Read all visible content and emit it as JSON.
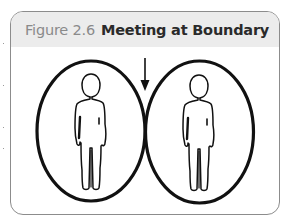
{
  "figure": {
    "number": "Figure 2.6",
    "caption": "Meeting at Boundary"
  },
  "diagram": {
    "arrow": "down-arrow-icon",
    "circles": [
      {
        "label": "left-person-boundary",
        "figure": "person-icon"
      },
      {
        "label": "right-person-boundary",
        "figure": "person-icon"
      }
    ]
  },
  "colors": {
    "header_bg": "#ececec",
    "border": "#8c8c8c",
    "stroke": "#111111",
    "number_text": "#8a8a8a",
    "caption_text": "#2a2a2a"
  }
}
